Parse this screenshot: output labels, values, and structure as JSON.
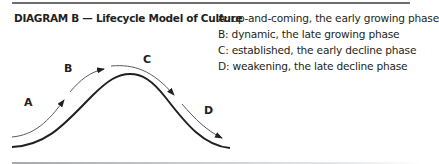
{
  "title": "DIAGRAM B — Lifecycle Model of Culture",
  "phase_labels": {
    "a": "A",
    "b": "B",
    "c": "C",
    "d": "D"
  },
  "legend": [
    "A: up-and-coming, the early growing phase",
    "B: dynamic, the late growing phase",
    "C: established, the early decline phase",
    "D: weakening, the late decline phase"
  ],
  "colors": {
    "curve": "#231f20",
    "arrow": "#58595b",
    "rule": "#6d6e70"
  }
}
